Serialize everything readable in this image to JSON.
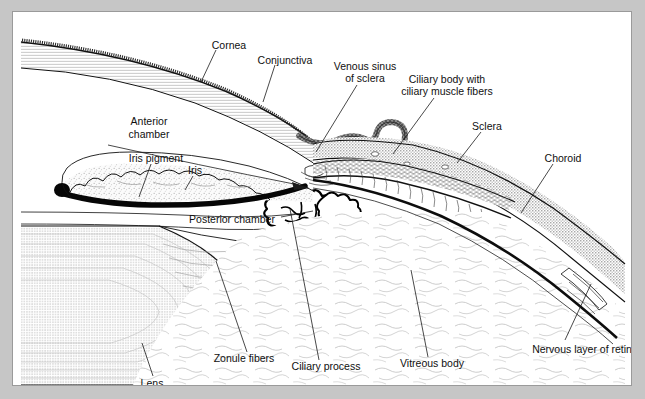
{
  "figure": {
    "kind": "anatomical-cross-section",
    "background_color": "#c6c6c6",
    "plate_color": "#ffffff",
    "line_color": "#111111",
    "sclera_fill": "#d9d9d9",
    "lens_fill": "#dedede",
    "iris_fill": "#f2f2f2",
    "pigment_fill": "#0d0d0d"
  },
  "labels": {
    "cornea": "Cornea",
    "conjunctiva": "Conjunctiva",
    "venous_sinus_line1": "Venous sinus",
    "venous_sinus_line2": "of sclera",
    "ciliary_body_line1": "Ciliary body with",
    "ciliary_body_line2": "ciliary muscle fibers",
    "sclera": "Sclera",
    "choroid": "Choroid",
    "anterior_chamber_line1": "Anterior",
    "anterior_chamber_line2": "chamber",
    "iris_pigment": "Iris pigment",
    "iris": "Iris",
    "posterior_chamber": "Posterior chamber",
    "zonule_fibers": "Zonule fibers",
    "ciliary_process": "Ciliary process",
    "vitreous_body": "Vitreous body",
    "nervous_layer_of_retina": "Nervous layer of retina",
    "lens": "Lens"
  },
  "label_positions": {
    "cornea": {
      "x": 216,
      "y": 33,
      "anchor": "middle"
    },
    "conjunctiva": {
      "x": 272,
      "y": 48,
      "anchor": "middle"
    },
    "venous_sinus_line1": {
      "x": 352,
      "y": 55,
      "anchor": "middle"
    },
    "venous_sinus_line2": {
      "x": 352,
      "y": 67,
      "anchor": "middle"
    },
    "ciliary_body_line1": {
      "x": 434,
      "y": 68,
      "anchor": "middle"
    },
    "ciliary_body_line2": {
      "x": 434,
      "y": 80,
      "anchor": "middle"
    },
    "sclera": {
      "x": 474,
      "y": 115,
      "anchor": "middle"
    },
    "choroid": {
      "x": 550,
      "y": 147,
      "anchor": "middle"
    },
    "anterior_chamber_line1": {
      "x": 136,
      "y": 110,
      "anchor": "middle"
    },
    "anterior_chamber_line2": {
      "x": 136,
      "y": 123,
      "anchor": "middle"
    },
    "iris_pigment": {
      "x": 143,
      "y": 147,
      "anchor": "middle"
    },
    "iris": {
      "x": 182,
      "y": 159,
      "anchor": "middle"
    },
    "posterior_chamber": {
      "x": 219,
      "y": 208,
      "anchor": "middle"
    },
    "zonule_fibers": {
      "x": 231,
      "y": 347,
      "anchor": "middle"
    },
    "ciliary_process": {
      "x": 313,
      "y": 355,
      "anchor": "middle"
    },
    "vitreous_body": {
      "x": 419,
      "y": 352,
      "anchor": "middle"
    },
    "nervous_layer_of_retina": {
      "x": 572,
      "y": 338,
      "anchor": "middle"
    },
    "lens": {
      "x": 139,
      "y": 372,
      "anchor": "middle"
    }
  },
  "leader_lines": {
    "cornea": "M 203,38 L 188,70",
    "conjunctiva": "M 262,53 L 250,90",
    "venous_sinus": "M 344,73 L 303,140",
    "ciliary_body": "M 421,86 L 380,142",
    "sclera": "M 468,120 L 444,151",
    "choroid": "M 540,152 L 508,201",
    "iris_pigment": "M 138,152 L 126,185",
    "iris": "M 180,164 L 172,178",
    "posterior_chamber": "M 266,204 L 300,198",
    "zonule_fibers": "M 234,340 L 203,249",
    "ciliary_process": "M 306,348 L 277,197",
    "vitreous_body": "M 415,345 L 398,258",
    "nervous_layer_of_retina": "M 552,328 L 578,272",
    "lens": "M 140,364 L 129,331",
    "anterior_chamber_arrow": "M 118,135 L 289,172"
  }
}
